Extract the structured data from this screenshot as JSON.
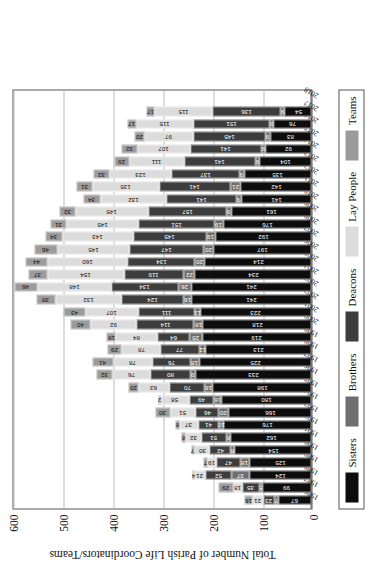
{
  "chart_data": {
    "type": "bar",
    "subtype": "stacked-bar",
    "title": "",
    "xlabel": "",
    "ylabel": "Total Number of Parish Life Coordinators/Teams",
    "ylim": [
      0,
      600
    ],
    "yticks": [
      "0",
      "100",
      "200",
      "300",
      "400",
      "500",
      "600"
    ],
    "grid": true,
    "legend_position": "bottom",
    "orientation": "rotated-90",
    "categories": [
      "1986",
      "1987",
      "1988",
      "1989",
      "1990",
      "1991",
      "1992",
      "1993",
      "1994",
      "1995",
      "1996",
      "1997",
      "1998",
      "1999",
      "2000",
      "2001",
      "2002",
      "2003",
      "2004",
      "2005",
      "2006",
      "2007",
      "2008",
      "2009",
      "2010",
      "2011",
      "2012",
      "2013",
      "2014",
      "2015",
      "2016",
      "2017",
      "2018"
    ],
    "series": [
      {
        "name": "Sisters",
        "color": "#0d0d0d",
        "values": [
          67,
          99,
          124,
          125,
          154,
          162,
          176,
          166,
          180,
          198,
          233,
          225,
          213,
          219,
          218,
          223,
          241,
          241,
          234,
          214,
          197,
          192,
          176,
          161,
          141,
          142,
          135,
          104,
          92,
          83,
          76,
          54,
          0
        ]
      },
      {
        "name": "Brothers",
        "color": "#6e6e6e",
        "values": [
          7,
          5,
          37,
          18,
          8,
          8,
          10,
          20,
          16,
          16,
          9,
          18,
          12,
          25,
          18,
          12,
          16,
          26,
          22,
          20,
          20,
          19,
          19,
          9,
          9,
          21,
          9,
          9,
          9,
          9,
          9,
          9,
          0
        ]
      },
      {
        "name": "Deacons",
        "color": "#3d3d3d",
        "values": [
          23,
          35,
          52,
          47,
          42,
          51,
          41,
          46,
          49,
          70,
          80,
          76,
          77,
          64,
          114,
          111,
          124,
          134,
          119,
          134,
          147,
          145,
          151,
          157,
          141,
          141,
          137,
          141,
          141,
          145,
          151,
          136,
          0
        ]
      },
      {
        "name": "Lay People",
        "color": "#dcdcdc",
        "values": [
          21,
          18,
          21,
          19,
          30,
          32,
          37,
          51,
          58,
          63,
          76,
          78,
          78,
          84,
          92,
          107,
          132,
          148,
          154,
          160,
          145,
          143,
          145,
          145,
          132,
          135,
          123,
          111,
          107,
          97,
          115,
          115,
          0
        ]
      },
      {
        "name": "Teams",
        "color": "#9b9b9b",
        "values": [
          16,
          29,
          4,
          7,
          7,
          8,
          8,
          30,
          2,
          20,
          32,
          41,
          29,
          18,
          40,
          43,
          38,
          46,
          37,
          44,
          46,
          34,
          31,
          32,
          34,
          31,
          32,
          29,
          32,
          20,
          17,
          17,
          0
        ]
      }
    ]
  },
  "legend": {
    "items": [
      {
        "label": "Sisters",
        "color": "#0d0d0d"
      },
      {
        "label": "Brothers",
        "color": "#6e6e6e"
      },
      {
        "label": "Deacons",
        "color": "#3d3d3d"
      },
      {
        "label": "Lay People",
        "color": "#dcdcdc"
      },
      {
        "label": "Teams",
        "color": "#9b9b9b"
      }
    ]
  }
}
